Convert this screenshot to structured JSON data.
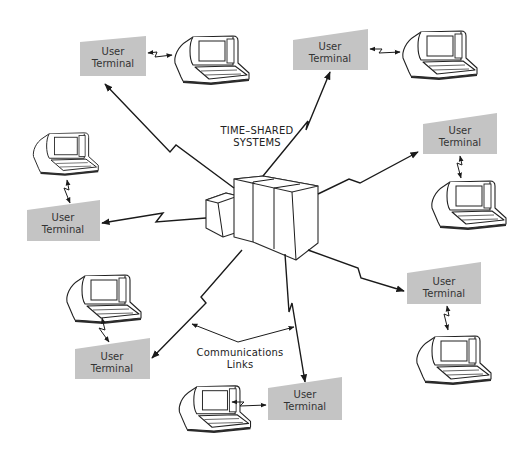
{
  "diagram": {
    "central_system": {
      "label_line1": "TIME–SHARED",
      "label_line2": "SYSTEMS"
    },
    "links_label": {
      "line1": "Communications",
      "line2": "Links"
    },
    "terminals": [
      {
        "id": "top-left",
        "line1": "User",
        "line2": "Terminal"
      },
      {
        "id": "top-right",
        "line1": "User",
        "line2": "Terminal"
      },
      {
        "id": "right-upper",
        "line1": "User",
        "line2": "Terminal"
      },
      {
        "id": "left",
        "line1": "User",
        "line2": "Terminal"
      },
      {
        "id": "right-lower",
        "line1": "User",
        "line2": "Terminal"
      },
      {
        "id": "bottom-left",
        "line1": "User",
        "line2": "Terminal"
      },
      {
        "id": "bottom-center",
        "line1": "User",
        "line2": "Terminal"
      }
    ],
    "colors": {
      "terminal_box": "#c4c4c4",
      "lines": "#1a1a1a",
      "background": "#ffffff"
    }
  }
}
